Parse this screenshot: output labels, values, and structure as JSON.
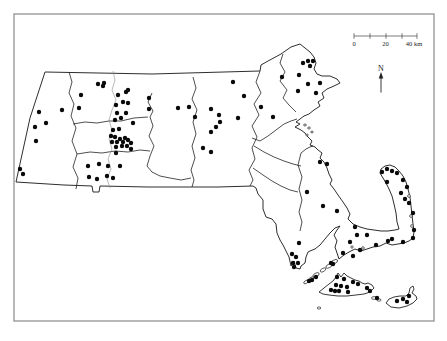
{
  "figure": {
    "background": "#ffffff",
    "frame_color": "#9a9a9a",
    "line_color": "#222222",
    "river_color": "#8a8a8a",
    "dot_color": "#0a0a0a",
    "dot_radius": 2.2,
    "scale_bar": {
      "y": 36,
      "tick_top": 33.2,
      "tick_bottom": 38.8,
      "x_start": 354,
      "x_end": 417,
      "tick_xs": [
        354,
        370,
        386,
        402,
        417
      ],
      "labels": [
        {
          "text": "0",
          "x": 354
        },
        {
          "text": "20",
          "x": 385.5
        },
        {
          "text": "40 km",
          "x": 414
        }
      ],
      "label_y": 45.5
    },
    "north_arrow": {
      "label": "N",
      "x": 381,
      "label_y": 70.5
    }
  },
  "map": {
    "mainland_path": "M 45,72 L 152,74 L 260,71 L 261,65 L 268,61 L 281,54 L 291,47 L 300,44 L 305,48 L 310,52 L 314,57 L 316,63 L 314,69 L 317,74 L 322,76 L 330,76 L 337,79 L 340,83 L 334,86 L 327,89 L 322,93 L 324,98 L 318,102 L 320,106 L 314,110 L 309,114 L 304,116 L 300,119 L 296,122 L 300,124 L 295,127 L 301,130 L 305,133 L 308,137 L 312,141 L 310,145 L 315,147 L 318,150 L 322,153 L 320,158 L 324,162 L 327,168 L 329,174 L 332,180 L 330,184 L 334,189 L 338,195 L 343,202 L 347,208 L 350,214 L 348,219 L 353,224 L 360,227 L 367,229 L 374,230 L 381,231 L 388,231 L 395,230 L 399,229 L 397,222 L 396,213 L 394,204 L 392,196 L 389,189 L 386,183 L 383,178 L 380,173 L 381,169 L 385,166 L 390,165 L 395,167 L 399,171 L 403,176 L 406,182 L 408,189 L 410,197 L 411,206 L 412,215 L 413,224 L 414,232 L 413,238 L 409,241 L 404,243 L 398,244 L 392,245 L 386,243 L 380,246 L 373,247 L 367,249 L 361,251 L 355,249 L 349,252 L 344,255 L 339,259 L 337,253 L 335,247 L 337,241 L 334,235 L 337,230 L 340,226 L 335,228 L 330,233 L 325,239 L 320,245 L 315,249 L 310,251 L 308,252 L 306,257 L 305,263 L 301,266 L 300,269 L 296,268 L 294,261 L 291,266 L 289,257 L 286,251 L 283,245 L 280,240 L 277,233 L 276,224 L 272,219 L 266,217 L 263,209 L 263,200 L 258,194 L 256,188 L 253,186 L 218,187 L 148,187 L 100,186 L 99,192 L 93,192 L 92,186 L 64,185 L 16,182 L 30,118 L 45,72 Z",
    "county_paths": [
      "M 69,72 L 72,82 L 69,93 L 74,104 L 71,116 L 76,128 L 72,141 L 77,154 L 73,167 L 78,178 L 76,189",
      "M 73,124 L 85,122 L 97,123 L 109,121 L 121,121 L 134,118 L 148,117",
      "M 152,93 L 148,102 L 153,111 L 150,117 L 153,126 L 149,136 L 154,146 L 150,156 L 147,166 L 152,172 L 160,176 L 170,178 L 181,180 L 191,178",
      "M 77,154 L 90,152 L 102,153 L 115,151 L 128,152 L 140,150 L 150,151",
      "M 193,77 L 196,88 L 192,99 L 197,110 L 193,122 L 196,134 L 192,146 L 195,158 L 191,170 L 194,180 L 192,187",
      "M 260,71 L 256,82 L 261,93 L 254,104 L 259,115 L 252,126 L 257,137 L 252,148 L 255,159 L 249,170 L 253,180 L 250,186",
      "M 283,54 L 280,63 L 285,72 L 280,81 L 287,90 L 283,98 L 289,105 L 296,112",
      "M 252,138 L 260,141 L 268,136 L 276,130 L 284,124 L 291,121 L 297,119",
      "M 254,146 L 264,152 L 274,157 L 284,161 L 293,164 L 301,166",
      "M 301,153 L 298,165 L 302,177 L 299,189 L 302,200 L 299,212 L 302,222 L 300,231",
      "M 301,153 L 306,149 L 310,147 L 313,146",
      "M 253,168 L 263,175 L 272,181 L 281,186 L 290,190 L 298,192"
    ],
    "river_path": "M 113,71 L 115,80 L 112,90 L 116,100 L 112,110 L 109,120 L 112,130 L 109,139 L 112,149 L 108,159 L 111,169 L 107,179 L 110,188",
    "island_paths": [
      "M 319,292 L 324,288 L 329,284 L 333,281 L 336,277 L 338,273 L 341,277 L 344,273 L 347,276 L 351,278 L 355,280 L 359,281 L 362,283 L 365,284 L 368,283 L 372,285 L 374,288 L 370,292 L 364,294 L 356,295 L 347,296 L 338,296 L 329,295 L 323,294 Z",
      "M 386,303 L 389,299 L 394,297 L 400,296 L 406,296 L 409,293 L 410,288 L 413,286 L 414,289 L 412,293 L 416,296 L 417,299 L 413,303 L 407,306 L 399,308 L 391,307 Z"
    ],
    "islets": [
      [
        334,
        262,
        4,
        1.8,
        -28
      ],
      [
        329,
        266,
        3.5,
        1.7,
        -28
      ],
      [
        323,
        270,
        3,
        1.6,
        -30
      ],
      [
        316,
        275,
        3.5,
        1.8,
        -30
      ],
      [
        311,
        279,
        3,
        1.6,
        -32
      ],
      [
        306,
        282,
        2.5,
        1.4,
        -32
      ],
      [
        374,
        298,
        2.5,
        1.4,
        0
      ],
      [
        379,
        300,
        2,
        1.2,
        0
      ],
      [
        319,
        308,
        1.8,
        1.1,
        0
      ],
      [
        305,
        125,
        1.4,
        1,
        0
      ],
      [
        309,
        128,
        1.4,
        1,
        0
      ],
      [
        312,
        132,
        1.3,
        0.9,
        0
      ],
      [
        307,
        135,
        1.2,
        0.9,
        0
      ],
      [
        409,
        196,
        1.4,
        1.4,
        0
      ],
      [
        411,
        216,
        1.4,
        1.4,
        0
      ],
      [
        412,
        226,
        1.4,
        1.4,
        0
      ],
      [
        363,
        248,
        1.3,
        1.3,
        0
      ],
      [
        352,
        247,
        1.2,
        1.2,
        0
      ]
    ],
    "dots": [
      [
        39,
        112
      ],
      [
        62,
        110
      ],
      [
        35,
        127
      ],
      [
        46,
        123
      ],
      [
        36,
        141
      ],
      [
        20,
        169
      ],
      [
        23,
        174
      ],
      [
        81,
        95
      ],
      [
        79,
        108
      ],
      [
        98,
        84
      ],
      [
        103,
        86
      ],
      [
        104,
        83
      ],
      [
        118,
        95
      ],
      [
        126,
        92
      ],
      [
        128,
        90
      ],
      [
        116,
        105
      ],
      [
        123,
        102
      ],
      [
        128,
        103
      ],
      [
        133,
        123
      ],
      [
        117,
        113
      ],
      [
        126,
        113
      ],
      [
        115,
        120
      ],
      [
        121,
        118
      ],
      [
        113,
        130
      ],
      [
        119,
        129
      ],
      [
        111,
        136
      ],
      [
        115,
        137
      ],
      [
        112,
        142
      ],
      [
        117,
        142
      ],
      [
        120,
        139
      ],
      [
        123,
        142
      ],
      [
        125,
        138
      ],
      [
        128,
        140
      ],
      [
        131,
        143
      ],
      [
        127,
        146
      ],
      [
        122,
        146
      ],
      [
        116,
        147
      ],
      [
        131,
        149
      ],
      [
        116,
        153
      ],
      [
        88,
        166
      ],
      [
        99,
        164
      ],
      [
        108,
        166
      ],
      [
        120,
        166
      ],
      [
        89,
        177
      ],
      [
        97,
        179
      ],
      [
        107,
        176
      ],
      [
        113,
        178
      ],
      [
        149,
        98
      ],
      [
        149,
        109
      ],
      [
        178,
        108
      ],
      [
        189,
        107
      ],
      [
        195,
        117
      ],
      [
        211,
        109
      ],
      [
        219,
        115
      ],
      [
        220,
        122
      ],
      [
        216,
        127
      ],
      [
        211,
        132
      ],
      [
        203,
        148
      ],
      [
        211,
        152
      ],
      [
        233,
        82
      ],
      [
        244,
        96
      ],
      [
        238,
        118
      ],
      [
        261,
        107
      ],
      [
        273,
        117
      ],
      [
        282,
        77
      ],
      [
        299,
        75
      ],
      [
        303,
        63
      ],
      [
        308,
        61
      ],
      [
        310,
        66
      ],
      [
        313,
        61
      ],
      [
        308,
        84
      ],
      [
        298,
        91
      ],
      [
        316,
        93
      ],
      [
        320,
        83
      ],
      [
        320,
        162
      ],
      [
        327,
        164
      ],
      [
        307,
        192
      ],
      [
        323,
        206
      ],
      [
        337,
        211
      ],
      [
        299,
        243
      ],
      [
        292,
        254
      ],
      [
        296,
        257
      ],
      [
        293,
        263
      ],
      [
        298,
        263
      ],
      [
        294,
        267
      ],
      [
        331,
        263
      ],
      [
        333,
        264
      ],
      [
        316,
        277
      ],
      [
        312,
        280
      ],
      [
        309,
        281
      ],
      [
        355,
        227
      ],
      [
        357,
        235
      ],
      [
        367,
        235
      ],
      [
        350,
        242
      ],
      [
        343,
        253
      ],
      [
        353,
        256
      ],
      [
        360,
        250
      ],
      [
        376,
        245
      ],
      [
        388,
        241
      ],
      [
        392,
        239
      ],
      [
        403,
        242
      ],
      [
        382,
        172
      ],
      [
        387,
        169
      ],
      [
        392,
        171
      ],
      [
        397,
        173
      ],
      [
        387,
        182
      ],
      [
        403,
        180
      ],
      [
        407,
        187
      ],
      [
        401,
        193
      ],
      [
        405,
        199
      ],
      [
        409,
        203
      ],
      [
        413,
        213
      ],
      [
        414,
        230
      ],
      [
        413,
        238
      ],
      [
        337,
        277
      ],
      [
        344,
        279
      ],
      [
        336,
        285
      ],
      [
        341,
        286
      ],
      [
        347,
        287
      ],
      [
        331,
        290
      ],
      [
        335,
        291
      ],
      [
        339,
        291
      ],
      [
        348,
        292
      ],
      [
        353,
        282
      ],
      [
        358,
        284
      ],
      [
        367,
        288
      ],
      [
        370,
        291
      ],
      [
        377,
        298
      ],
      [
        397,
        301
      ],
      [
        403,
        299
      ],
      [
        407,
        302
      ],
      [
        409,
        296
      ]
    ]
  }
}
